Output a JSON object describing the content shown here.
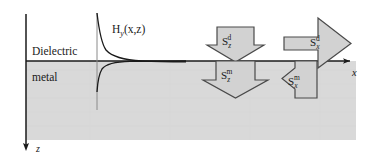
{
  "figure": {
    "type": "physics-diagram",
    "background_color": "#ffffff",
    "line_color": "#1a1a1a",
    "metal_fill_color": "#d9d9d9",
    "arrow_fill_color": "#d2d2d2"
  },
  "regions": {
    "upper_label": "Dielectric",
    "lower_label": "metal",
    "interface_y": 61
  },
  "axes": {
    "x_label": "x",
    "z_label": "z",
    "x_axis_y": 61,
    "z_axis_x": 26,
    "x_axis_start": 26,
    "x_axis_end": 352,
    "z_axis_start": 14,
    "z_axis_end": 148
  },
  "field_curve": {
    "label_base": "H",
    "label_subscript": "y",
    "label_args": "(x,z)",
    "label_full": "H_y(x,z)",
    "baseline_x": 97,
    "description": "Magnetic field amplitude profile, exponentially decaying away from the interface; slower decay into the dielectric, faster decay into the metal"
  },
  "flux_arrows": [
    {
      "id": "Szd",
      "base": "S",
      "subscript": "z",
      "superscript": "d",
      "label_full": "S_z^d",
      "direction": "down",
      "region": "dielectric",
      "meaning": "z-component of Poynting vector in the dielectric"
    },
    {
      "id": "Szm",
      "base": "S",
      "subscript": "z",
      "superscript": "m",
      "label_full": "S_z^m",
      "direction": "down",
      "region": "metal",
      "meaning": "z-component of Poynting vector in the metal"
    },
    {
      "id": "Sxd",
      "base": "S",
      "subscript": "x",
      "superscript": "d",
      "label_full": "S_x^d",
      "direction": "right",
      "region": "dielectric",
      "meaning": "x-component of Poynting vector in the dielectric"
    },
    {
      "id": "Sxm",
      "base": "S",
      "subscript": "x",
      "superscript": "m",
      "label_full": "S_x^m",
      "direction": "left",
      "region": "metal",
      "meaning": "x-component of Poynting vector in the metal"
    }
  ]
}
